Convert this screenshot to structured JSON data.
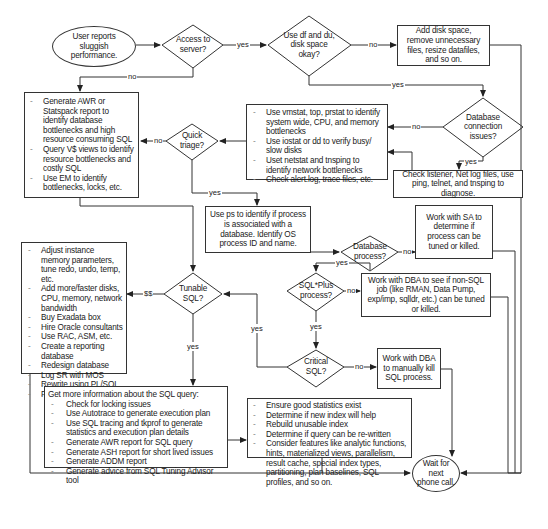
{
  "start": {
    "text": "User reports sluggish performance."
  },
  "end": {
    "text": "Wait for next phone call."
  },
  "decisions": {
    "access": "Access to server?",
    "disk": "Use df and du, disk space okay?",
    "dbconn": "Database connection issues?",
    "triage": "Quick triage?",
    "dbproc": "Database process?",
    "sqlplus": "SQL*Plus process?",
    "tunable": "Tunable SQL?",
    "critical": "Critical SQL?"
  },
  "boxes": {
    "add_disk": "Add disk space, remove unnecessary files, resize datafiles, and so on.",
    "awr": [
      "Generate AWR or Statspack report to identify database bottlenecks and high resource consuming SQL",
      "Query V$ views to identify resource bottlenecks and costly SQL",
      "Use EM to identify bottlenecks, locks, etc."
    ],
    "os_tools": [
      "Use vmstat, top, prstat to identify system wide, CPU, and memory bottlenecks",
      "Use iostat or dd to verify busy/ slow disks",
      "Uset netstat and tnsping to identify network bottlenecks",
      "Check alert.log, trace files, etc."
    ],
    "listener": "Check listener, Net log files, use ping, telnet, and tnsping to diagnose.",
    "ps": "Use ps to identify if process is associated with a  database. Identify OS process ID and name.",
    "sa": "Work with SA to determine if process can be tuned or killed.",
    "non_sql": "Work with DBA to see if non-SQL job (like RMAN, Data Pump, exp/imp, sqlldr, etc.) can be tuned or killed.",
    "kill_sql": "Work with DBA to manually kill SQL process.",
    "money": [
      "Adjust instance memory parameters, tune redo, undo, temp, etc.",
      "Add more/faster disks, CPU, memory, network bandwidth",
      "Buy Exadata box",
      "Hire Oracle consultants",
      "Use RAC, ASM, etc.",
      "Create a reporting database",
      "Redesign database",
      "Log SR with MOS",
      "Rewrite using PL/SQL",
      "Find new job"
    ],
    "sql_info": {
      "title": "Get more information about the SQL query:",
      "items": [
        "Check for locking issues",
        "Use Autotrace to generate execution plan",
        "Use SQL tracing and tkprof to generate statistics and execution plan details",
        "Generate AWR report for SQL query",
        "Generate ASH report for short lived issues",
        "Generate ADDM report",
        "Generate advice from SQL Tuning Advisor tool"
      ]
    },
    "tuning": [
      "Ensure good statistics exist",
      "Determine if new index will help",
      "Rebuild unusable index",
      "Determine if query can be re-written",
      "Consider features like analytic functions, hints, materialized views, parallelism, result cache, special index types, partitioning, plan baselines, SQL profiles, and so on."
    ]
  },
  "edge_labels": {
    "access_yes": "yes",
    "access_no": "no",
    "disk_no": "no",
    "disk_yes": "yes",
    "dbconn_no": "no",
    "dbconn_yes": "yes",
    "triage_no": "no",
    "triage_yes": "yes",
    "dbproc_no": "no",
    "dbproc_yes": "yes",
    "sqlplus_no": "no",
    "sqlplus_yes": "yes",
    "tunable_money": "$$",
    "tunable_yes": "yes",
    "critical_no": "no",
    "critical_yes": "yes"
  },
  "colors": {
    "line": "#333333",
    "text": "#1a1a1a",
    "background": "#ffffff"
  }
}
